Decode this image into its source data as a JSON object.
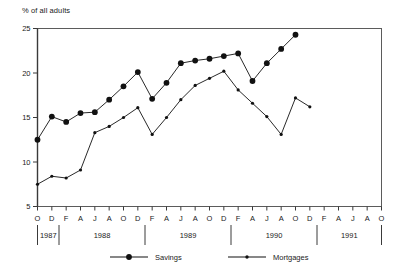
{
  "chart_data": {
    "type": "line",
    "title": "",
    "ylabel": "% of all adults",
    "xlabel": "",
    "ylim": [
      5,
      25
    ],
    "yticks": [
      5,
      10,
      15,
      20,
      25
    ],
    "grid": false,
    "legend_position": "bottom",
    "x": [
      "O",
      "D",
      "F",
      "A",
      "J",
      "A",
      "O",
      "D",
      "F",
      "A",
      "J",
      "A",
      "O",
      "D",
      "F",
      "A",
      "J",
      "A",
      "O",
      "D",
      "F",
      "A",
      "J",
      "A",
      "O"
    ],
    "year_groups": [
      {
        "label": "1987",
        "start_index": 0,
        "end_index": 1
      },
      {
        "label": "1988",
        "start_index": 2,
        "end_index": 7
      },
      {
        "label": "1989",
        "start_index": 8,
        "end_index": 13
      },
      {
        "label": "1990",
        "start_index": 14,
        "end_index": 19
      },
      {
        "label": "1991",
        "start_index": 20,
        "end_index": 24
      }
    ],
    "series": [
      {
        "name": "Savings",
        "marker": "large-dot",
        "color": "#111111",
        "values": [
          12.5,
          15.1,
          14.5,
          15.5,
          15.6,
          17.0,
          18.5,
          20.1,
          17.1,
          18.9,
          21.1,
          21.4,
          21.6,
          21.9,
          22.2,
          19.1,
          21.1,
          22.7,
          24.3,
          null,
          null,
          null,
          null,
          null,
          null
        ]
      },
      {
        "name": "Mortgages",
        "marker": "small-dot",
        "color": "#111111",
        "values": [
          7.5,
          8.4,
          8.2,
          9.1,
          13.3,
          14.0,
          15.0,
          16.1,
          13.1,
          15.0,
          17.0,
          18.6,
          19.4,
          20.2,
          18.1,
          16.6,
          15.1,
          13.1,
          17.2,
          16.2,
          null,
          null,
          null,
          null,
          null
        ]
      }
    ],
    "savings_points": [
      {
        "x": "O",
        "year": "1987",
        "y": 12.5
      },
      {
        "x": "D",
        "year": "1987",
        "y": 15.1
      },
      {
        "x": "F",
        "year": "1988",
        "y": 14.5
      },
      {
        "x": "A",
        "year": "1988",
        "y": 15.5
      },
      {
        "x": "J",
        "year": "1988",
        "y": 15.6
      },
      {
        "x": "A",
        "year": "1988",
        "y": 17.0
      },
      {
        "x": "O",
        "year": "1988",
        "y": 18.5
      },
      {
        "x": "D",
        "year": "1988",
        "y": 20.1
      },
      {
        "x": "F",
        "year": "1989",
        "y": 17.1
      },
      {
        "x": "A",
        "year": "1989",
        "y": 18.9
      },
      {
        "x": "J",
        "year": "1989",
        "y": 21.1
      },
      {
        "x": "A",
        "year": "1989",
        "y": 21.4
      },
      {
        "x": "O",
        "year": "1989",
        "y": 21.6
      },
      {
        "x": "D",
        "year": "1989",
        "y": 21.9
      },
      {
        "x": "F",
        "year": "1990",
        "y": 22.2
      },
      {
        "x": "A",
        "year": "1990",
        "y": 19.1
      },
      {
        "x": "J",
        "year": "1990",
        "y": 21.1
      },
      {
        "x": "A",
        "year": "1990",
        "y": 22.7
      },
      {
        "x": "O",
        "year": "1990",
        "y": 24.3
      }
    ],
    "mortgages_points": [
      {
        "x": "O",
        "year": "1987",
        "y": 7.5
      },
      {
        "x": "D",
        "year": "1987",
        "y": 8.4
      },
      {
        "x": "F",
        "year": "1988",
        "y": 8.2
      },
      {
        "x": "A",
        "year": "1988",
        "y": 9.1
      },
      {
        "x": "J",
        "year": "1988",
        "y": 13.3
      },
      {
        "x": "A",
        "year": "1988",
        "y": 14.0
      },
      {
        "x": "O",
        "year": "1988",
        "y": 15.0
      },
      {
        "x": "D",
        "year": "1988",
        "y": 16.1
      },
      {
        "x": "F",
        "year": "1989",
        "y": 13.1
      },
      {
        "x": "A",
        "year": "1989",
        "y": 15.0
      },
      {
        "x": "J",
        "year": "1989",
        "y": 17.0
      },
      {
        "x": "A",
        "year": "1989",
        "y": 18.6
      },
      {
        "x": "O",
        "year": "1989",
        "y": 19.4
      },
      {
        "x": "D",
        "year": "1989",
        "y": 20.2
      },
      {
        "x": "F",
        "year": "1990",
        "y": 18.1
      },
      {
        "x": "A",
        "year": "1990",
        "y": 16.6
      },
      {
        "x": "J",
        "year": "1990",
        "y": 15.1
      },
      {
        "x": "A",
        "year": "1990",
        "y": 13.1
      },
      {
        "x": "O",
        "year": "1990",
        "y": 17.2
      },
      {
        "x": "D",
        "year": "1990",
        "y": 16.2
      }
    ]
  },
  "legend": {
    "items": [
      {
        "label": "Savings",
        "marker": "large-dot"
      },
      {
        "label": "Mortgages",
        "marker": "small-dot"
      }
    ]
  },
  "axes": {
    "y_axis_label": "% of all adults",
    "y_tick_labels": [
      "25",
      "20",
      "15",
      "10",
      "5"
    ],
    "x_tick_labels": [
      "O",
      "D",
      "F",
      "A",
      "J",
      "A",
      "O",
      "D",
      "F",
      "A",
      "J",
      "A",
      "O",
      "D",
      "F",
      "A",
      "J",
      "A",
      "O",
      "D",
      "F",
      "A",
      "J",
      "A",
      "O"
    ],
    "year_labels": [
      "1987",
      "1988",
      "1989",
      "1990",
      "1991"
    ]
  }
}
